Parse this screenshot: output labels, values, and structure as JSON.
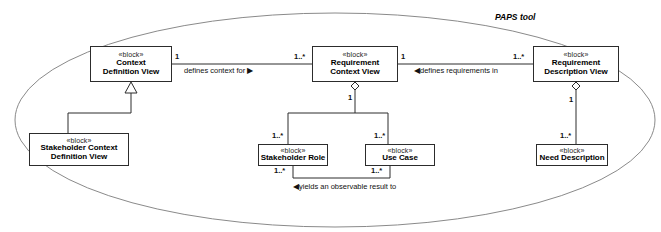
{
  "diagram": {
    "title": "PAPS tool",
    "type": "sysml-block-definition-diagram",
    "boundary_shape": "ellipse",
    "stereotype_label": "«block»",
    "blocks": [
      {
        "id": "context-definition-view",
        "stereotype": "«block»",
        "name_line1": "Context",
        "name_line2": "Definition View"
      },
      {
        "id": "requirement-context-view",
        "stereotype": "«block»",
        "name_line1": "Requirement",
        "name_line2": "Context View"
      },
      {
        "id": "requirement-description-view",
        "stereotype": "«block»",
        "name_line1": "Requirement",
        "name_line2": "Description View"
      },
      {
        "id": "stakeholder-context-definition-view",
        "stereotype": "«block»",
        "name_line1": "Stakeholder Context",
        "name_line2": "Definition View"
      },
      {
        "id": "stakeholder-role",
        "stereotype": "«block»",
        "name_line1": "Stakeholder Role",
        "name_line2": ""
      },
      {
        "id": "use-case",
        "stereotype": "«block»",
        "name_line1": "Use Case",
        "name_line2": ""
      },
      {
        "id": "need-description",
        "stereotype": "«block»",
        "name_line1": "Need Description",
        "name_line2": ""
      }
    ],
    "associations": [
      {
        "id": "defines-context-for",
        "label": "defines context for",
        "arrow": "▶",
        "arrow_direction": "right",
        "source": "context-definition-view",
        "target": "requirement-context-view",
        "source_multiplicity": "1",
        "target_multiplicity": "1..*"
      },
      {
        "id": "defines-requirements-in",
        "label": "defines requirements in",
        "arrow": "◀",
        "arrow_direction": "left",
        "source": "requirement-description-view",
        "target": "requirement-context-view",
        "source_multiplicity": "1..*",
        "target_multiplicity": "1"
      },
      {
        "id": "yields-an-observable-result-to",
        "label": "yields an observable result to",
        "arrow": "◀",
        "arrow_direction": "left",
        "source": "use-case",
        "target": "stakeholder-role",
        "source_multiplicity": "1..*",
        "target_multiplicity": "1..*"
      }
    ],
    "aggregations": [
      {
        "id": "rcv-aggregates-stakeholder-role",
        "whole": "requirement-context-view",
        "part": "stakeholder-role",
        "whole_multiplicity": "1",
        "part_multiplicity": "1..*"
      },
      {
        "id": "rcv-aggregates-use-case",
        "whole": "requirement-context-view",
        "part": "use-case",
        "whole_multiplicity": "1",
        "part_multiplicity": "1..*"
      },
      {
        "id": "rdv-aggregates-need-description",
        "whole": "requirement-description-view",
        "part": "need-description",
        "whole_multiplicity": "1",
        "part_multiplicity": "1..*"
      }
    ],
    "generalizations": [
      {
        "id": "scdv-generalizes-cdv",
        "child": "stakeholder-context-definition-view",
        "parent": "context-definition-view"
      }
    ],
    "multiplicity_labels": {
      "cdv_right": "1",
      "rcv_left": "1..*",
      "rcv_right": "1",
      "rdv_left": "1..*",
      "rcv_bottom": "1",
      "stakeholder_role_top": "1..*",
      "use_case_top": "1..*",
      "stakeholder_role_bottom": "1..*",
      "use_case_bottom": "1..*",
      "rdv_bottom": "1",
      "need_description_top": "1..*"
    },
    "colors": {
      "line": "#2c2c2c",
      "boundary": "#8a8a8a",
      "text": "#000000",
      "background": "#ffffff"
    }
  }
}
